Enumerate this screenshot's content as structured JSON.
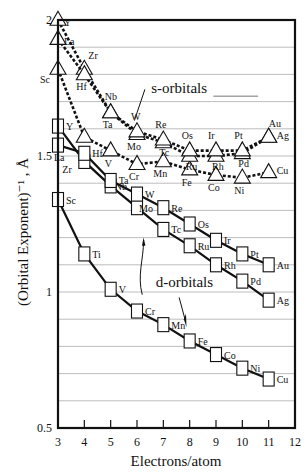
{
  "chart_data": {
    "type": "line",
    "title": "",
    "xlabel": "Electrons/atom",
    "ylabel": "(Orbital Exponent)⁻¹ , Å",
    "xlim": [
      3,
      12
    ],
    "ylim": [
      0.5,
      2
    ],
    "x_ticks": [
      3,
      4,
      5,
      6,
      7,
      8,
      9,
      10,
      11,
      12
    ],
    "y_ticks": [
      0.5,
      1,
      1.5,
      2
    ],
    "y_tick_labels": [
      "0.5",
      "1",
      "1.5",
      "2"
    ],
    "grid": {
      "horizontal": true,
      "step": 0.1
    },
    "annotations": [
      {
        "text": "s-orbitals",
        "x": 7.6,
        "y": 1.73
      },
      {
        "text": "d-orbitals",
        "x": 7.8,
        "y": 1.02
      }
    ],
    "series": [
      {
        "name": "s-orbitals 3d",
        "orbital": "s",
        "marker": "triangle",
        "style": "dashed",
        "x": [
          3,
          4,
          5,
          6,
          7,
          8,
          9,
          10,
          11
        ],
        "labels": [
          "Sc",
          "Ti",
          "V",
          "Cr",
          "Mn",
          "Fe",
          "Co",
          "Ni",
          "Cu"
        ],
        "values": [
          1.82,
          1.57,
          1.52,
          1.47,
          1.48,
          1.45,
          1.43,
          1.42,
          1.44
        ]
      },
      {
        "name": "s-orbitals 4d",
        "orbital": "s",
        "marker": "triangle",
        "style": "dashed",
        "x": [
          3,
          4,
          5,
          6,
          7,
          8,
          9,
          10,
          11
        ],
        "labels": [
          "Y",
          "Zr",
          "Nb",
          "Mo",
          "Tc",
          "Ru",
          "Rh",
          "Pd",
          "Ag"
        ],
        "values": [
          2.0,
          1.82,
          1.66,
          1.58,
          1.55,
          1.5,
          1.5,
          1.51,
          1.57
        ]
      },
      {
        "name": "s-orbitals 5d",
        "orbital": "s",
        "marker": "triangle",
        "style": "dashed",
        "x": [
          3,
          4,
          5,
          6,
          7,
          8,
          9,
          10,
          11
        ],
        "labels": [
          "La",
          "Hf",
          "Ta",
          "W",
          "Re",
          "Os",
          "Ir",
          "Pt",
          "Au"
        ],
        "values": [
          1.93,
          1.8,
          1.66,
          1.59,
          1.56,
          1.52,
          1.52,
          1.52,
          1.57
        ]
      },
      {
        "name": "d-orbitals 3d",
        "orbital": "d",
        "marker": "square",
        "style": "solid",
        "x": [
          3,
          4,
          5,
          6,
          7,
          8,
          9,
          10,
          11
        ],
        "labels": [
          "Sc",
          "Ti",
          "V",
          "Cr",
          "Mn",
          "Fe",
          "Co",
          "Ni",
          "Cu"
        ],
        "values": [
          1.34,
          1.14,
          1.01,
          0.93,
          0.88,
          0.82,
          0.77,
          0.72,
          0.68
        ]
      },
      {
        "name": "d-orbitals 4d",
        "orbital": "d",
        "marker": "square",
        "style": "solid",
        "x": [
          3,
          4,
          5,
          6,
          7,
          8,
          9,
          10,
          11
        ],
        "labels": [
          "Y",
          "Zr",
          "Nb",
          "Mo",
          "Tc",
          "Ru",
          "Rh",
          "Pd",
          "Ag"
        ],
        "values": [
          1.61,
          1.48,
          1.39,
          1.31,
          1.23,
          1.17,
          1.1,
          1.04,
          0.97
        ]
      },
      {
        "name": "d-orbitals 5d",
        "orbital": "d",
        "marker": "square",
        "style": "solid",
        "x": [
          3,
          4,
          5,
          6,
          7,
          8,
          9,
          10,
          11
        ],
        "labels": [
          "La",
          "Hf",
          "Ta",
          "W",
          "Re",
          "Os",
          "Ir",
          "Pt",
          "Au"
        ],
        "values": [
          1.54,
          1.51,
          1.41,
          1.36,
          1.31,
          1.25,
          1.19,
          1.14,
          1.1
        ]
      }
    ]
  }
}
